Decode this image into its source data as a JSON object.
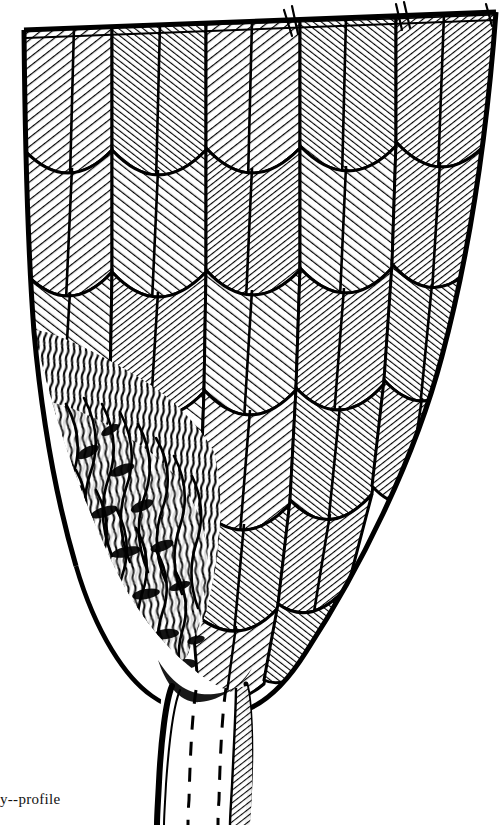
{
  "figure": {
    "medium": "pen-and-ink line engraving",
    "view": "profile",
    "caption_text": "y--profile",
    "caption_note": "caption is cropped at the left page margin",
    "canvas": {
      "width_px": 504,
      "height_px": 825,
      "background_color": "#ffffff",
      "ink_color": "#000000"
    },
    "regions": [
      {
        "name": "top-cut-edge",
        "label": "straight ruled cut line across top of plate",
        "y_px": 28
      },
      {
        "name": "vaned-feather-field",
        "label": "field of overlapping rounded contour feathers with herringbone barb hatching",
        "rows": 5,
        "columns": 5
      },
      {
        "name": "downy-region",
        "label": "loose downy plumulaceous barbs, lower left",
        "x_px": 60,
        "y_px": 395,
        "width_px": 180,
        "height_px": 285
      },
      {
        "name": "calamus",
        "label": "quill shaft / calamus emerging at base with dashed hidden edges",
        "x_px": 150,
        "y_px": 680,
        "width_px": 120,
        "height_px": 145
      }
    ],
    "outline": {
      "description": "broad flat top tapering to a narrow quill at the base",
      "top_left_px": [
        24,
        32
      ],
      "top_right_px": [
        496,
        14
      ],
      "taper_to_px": [
        205,
        690
      ]
    }
  }
}
